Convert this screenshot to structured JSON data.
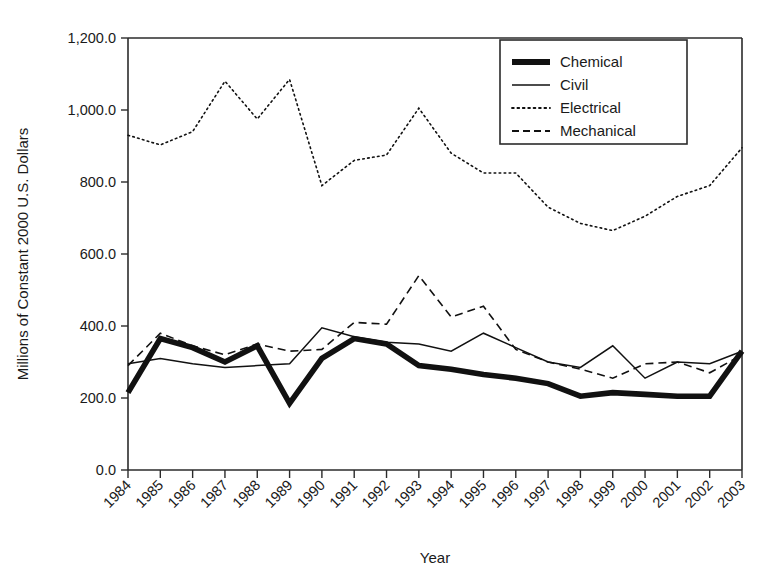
{
  "chart_data": {
    "type": "line",
    "title": "",
    "xlabel": "Year",
    "ylabel": "Millions of Constant 2000 U.S. Dollars",
    "grid": false,
    "legend_position": "top-right",
    "xlim": [
      1984,
      2003
    ],
    "ylim": [
      0,
      1200
    ],
    "ytick_labels": [
      "1,200.0",
      "1,000.0",
      "800.0",
      "600.0",
      "400.0",
      "200.0",
      "0.0"
    ],
    "ytick_values": [
      1200,
      1000,
      800,
      600,
      400,
      200,
      0
    ],
    "categories": [
      "1984",
      "1985",
      "1986",
      "1987",
      "1988",
      "1989",
      "1990",
      "1991",
      "1992",
      "1993",
      "1994",
      "1995",
      "1996",
      "1997",
      "1998",
      "1999",
      "2000",
      "2001",
      "2002",
      "2003"
    ],
    "x": [
      1984,
      1985,
      1986,
      1987,
      1988,
      1989,
      1990,
      1991,
      1992,
      1993,
      1994,
      1995,
      1996,
      1997,
      1998,
      1999,
      2000,
      2001,
      2002,
      2003
    ],
    "series": [
      {
        "name": "Chemical",
        "style": "thick-solid",
        "color": "#111111",
        "values": [
          215,
          365,
          340,
          300,
          345,
          185,
          310,
          365,
          350,
          290,
          280,
          265,
          255,
          240,
          205,
          215,
          210,
          205,
          205,
          330
        ]
      },
      {
        "name": "Civil",
        "style": "thin-solid",
        "color": "#111111",
        "values": [
          295,
          310,
          295,
          285,
          290,
          295,
          395,
          370,
          355,
          350,
          330,
          380,
          340,
          300,
          285,
          345,
          255,
          300,
          295,
          330
        ]
      },
      {
        "name": "Electrical",
        "style": "dotted",
        "color": "#111111",
        "values": [
          930,
          903,
          940,
          1080,
          975,
          1085,
          790,
          860,
          875,
          1005,
          880,
          825,
          825,
          730,
          685,
          665,
          705,
          760,
          790,
          895
        ]
      },
      {
        "name": "Mechanical",
        "style": "dashed",
        "color": "#111111",
        "values": [
          290,
          380,
          345,
          320,
          350,
          330,
          335,
          410,
          405,
          540,
          425,
          455,
          335,
          300,
          280,
          255,
          295,
          300,
          270,
          320
        ]
      }
    ]
  },
  "legend": {
    "entries": [
      {
        "label": "Chemical",
        "style": "thick-solid"
      },
      {
        "label": "Civil",
        "style": "thin-solid"
      },
      {
        "label": "Electrical",
        "style": "dotted"
      },
      {
        "label": "Mechanical",
        "style": "dashed"
      }
    ]
  }
}
